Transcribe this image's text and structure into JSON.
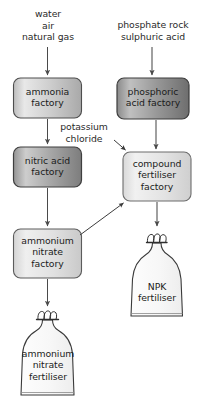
{
  "diagram": {
    "background_color": "#ffffff",
    "text_color": "#1b1b1b",
    "inputs": {
      "ammonia_feedstock": "water\nair\nnatural gas",
      "phosphoric_feedstock": "phosphate rock\nsulphuric acid",
      "potassium_chloride": "potassium\nchloride"
    },
    "processes": [
      {
        "id": "ammonia-factory",
        "label": "ammonia\nfactory",
        "fill_light": "#e4e4e4",
        "fill_dark": "#9e9e9e",
        "stroke": "#4a4a4a"
      },
      {
        "id": "phosphoric-acid-factory",
        "label": "phosphoric\nacid factory",
        "fill_light": "#b8b8b8",
        "fill_dark": "#6f6f6f",
        "stroke": "#3d3d3d"
      },
      {
        "id": "nitric-acid-factory",
        "label": "nitric acid\nfactory",
        "fill_light": "#c9c9c9",
        "fill_dark": "#7d7d7d",
        "stroke": "#3d3d3d"
      },
      {
        "id": "compound-fertiliser-factory",
        "label": "compound\nfertiliser\nfactory",
        "fill_light": "#ededed",
        "fill_dark": "#d4d4d4",
        "stroke": "#6a6a6a"
      },
      {
        "id": "ammonium-nitrate-factory",
        "label": "ammonium\nnitrate\nfactory",
        "fill_light": "#ebebeb",
        "fill_dark": "#cfcfcf",
        "stroke": "#5a5a5a"
      }
    ],
    "products": [
      {
        "id": "npk-fertiliser-bag",
        "label": "NPK\nfertiliser",
        "fill": "#fbfbfb",
        "stroke": "#3a3a3a"
      },
      {
        "id": "ammonium-nitrate-fertiliser-bag",
        "label": "ammonium\nnitrate\nfertiliser",
        "fill": "#fbfbfb",
        "stroke": "#3a3a3a"
      }
    ],
    "arrow_color": "#4a4a4a"
  }
}
